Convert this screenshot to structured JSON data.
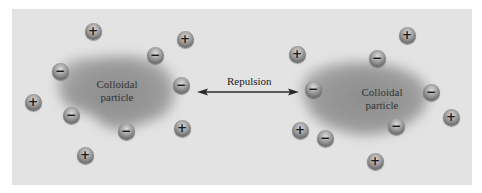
{
  "diagram": {
    "background_color": "#e3e3e3",
    "particles": [
      {
        "id": "left",
        "label_line1": "Colloidal",
        "label_line2": "particle",
        "center": [
          117,
          91
        ]
      },
      {
        "id": "right",
        "label_line1": "Colloidal",
        "label_line2": "particle",
        "center": [
          382,
          98
        ]
      }
    ],
    "repulsion": {
      "label": "Repulsion",
      "from": [
        197,
        92
      ],
      "to": [
        299,
        92
      ]
    },
    "ions": [
      {
        "charge": "+",
        "x": 93,
        "y": 31
      },
      {
        "charge": "+",
        "x": 185,
        "y": 39
      },
      {
        "charge": "−",
        "x": 155,
        "y": 55
      },
      {
        "charge": "−",
        "x": 60,
        "y": 71
      },
      {
        "charge": "−",
        "x": 181,
        "y": 85
      },
      {
        "charge": "+",
        "x": 33,
        "y": 102
      },
      {
        "charge": "−",
        "x": 71,
        "y": 115
      },
      {
        "charge": "−",
        "x": 126,
        "y": 131
      },
      {
        "charge": "+",
        "x": 182,
        "y": 128
      },
      {
        "charge": "+",
        "x": 85,
        "y": 155
      },
      {
        "charge": "+",
        "x": 407,
        "y": 35
      },
      {
        "charge": "+",
        "x": 297,
        "y": 54
      },
      {
        "charge": "−",
        "x": 377,
        "y": 58
      },
      {
        "charge": "−",
        "x": 313,
        "y": 89
      },
      {
        "charge": "−",
        "x": 431,
        "y": 92
      },
      {
        "charge": "+",
        "x": 451,
        "y": 117
      },
      {
        "charge": "+",
        "x": 300,
        "y": 130
      },
      {
        "charge": "−",
        "x": 325,
        "y": 138
      },
      {
        "charge": "−",
        "x": 396,
        "y": 126
      },
      {
        "charge": "+",
        "x": 375,
        "y": 161
      }
    ]
  }
}
